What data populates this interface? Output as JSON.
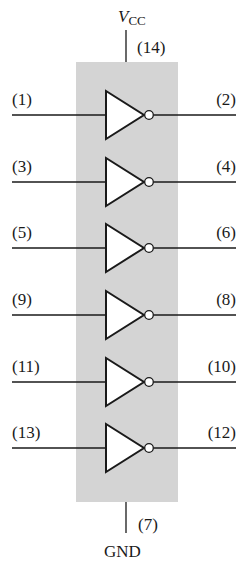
{
  "colors": {
    "chip_fill": "#d4d4d4",
    "line": "#1a1a1a",
    "gate_fill": "#ffffff"
  },
  "power": {
    "label_main": "V",
    "label_sub": "CC",
    "pin": "(14)"
  },
  "ground": {
    "label": "GND",
    "pin": "(7)"
  },
  "gates": [
    {
      "input_pin": "(1)",
      "output_pin": "(2)",
      "y": 115
    },
    {
      "input_pin": "(3)",
      "output_pin": "(4)",
      "y": 182
    },
    {
      "input_pin": "(5)",
      "output_pin": "(6)",
      "y": 248
    },
    {
      "input_pin": "(9)",
      "output_pin": "(8)",
      "y": 315
    },
    {
      "input_pin": "(11)",
      "output_pin": "(10)",
      "y": 382
    },
    {
      "input_pin": "(13)",
      "output_pin": "(12)",
      "y": 448
    }
  ]
}
